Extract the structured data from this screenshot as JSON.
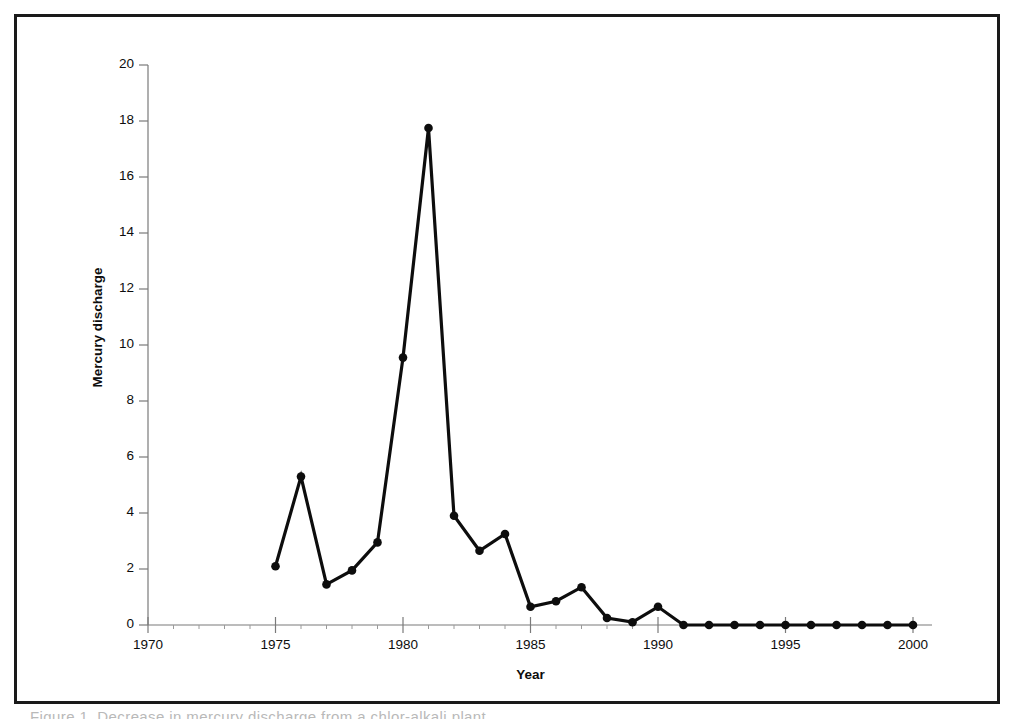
{
  "figure": {
    "caption_fragment": "Figure 1.  Decrease in mercury discharge from a chlor-alkali plant",
    "frame_color": "#1a1a1a",
    "background_color": "#ffffff"
  },
  "chart_data": {
    "type": "line",
    "title": "",
    "subtitle": "",
    "xlabel": "Year",
    "ylabel": "Mercury discharge",
    "xlim": [
      1970,
      2001
    ],
    "ylim": [
      0,
      20
    ],
    "grid": false,
    "legend": null,
    "series_color": "#0d0d0d",
    "marker": "filled-circle",
    "x_tick_labels": [
      "1970",
      "1975",
      "1980",
      "1985",
      "1990",
      "1995",
      "2000"
    ],
    "x_ticks": [
      1970,
      1975,
      1980,
      1985,
      1990,
      1995,
      2000
    ],
    "x_minor_ticks": [
      1971,
      1972,
      1973,
      1974,
      1976,
      1977,
      1978,
      1979,
      1981,
      1982,
      1983,
      1984,
      1986,
      1987,
      1988,
      1989,
      1991,
      1992,
      1993,
      1994,
      1996,
      1997,
      1998,
      1999
    ],
    "y_tick_labels": [
      "0",
      "2",
      "4",
      "6",
      "8",
      "10",
      "12",
      "14",
      "16",
      "18",
      "20"
    ],
    "y_ticks": [
      0,
      2,
      4,
      6,
      8,
      10,
      12,
      14,
      16,
      18,
      20
    ],
    "x": [
      1975,
      1976,
      1977,
      1978,
      1979,
      1980,
      1981,
      1982,
      1983,
      1984,
      1985,
      1986,
      1987,
      1988,
      1989,
      1990,
      1991,
      1992,
      1993,
      1994,
      1995,
      1996,
      1997,
      1998,
      1999,
      2000
    ],
    "values": [
      2.1,
      5.3,
      1.45,
      1.95,
      2.95,
      9.55,
      17.75,
      3.9,
      2.65,
      3.25,
      0.65,
      0.85,
      1.35,
      0.25,
      0.1,
      0.65,
      0.0,
      0.0,
      0.0,
      0.0,
      0.0,
      0.0,
      0.0,
      0.0,
      0.0,
      0.0
    ],
    "annotations": []
  }
}
